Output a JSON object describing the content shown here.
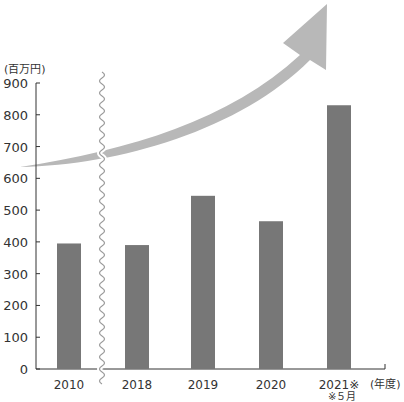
{
  "chart_data": {
    "type": "bar",
    "title": "",
    "ylabel": "(百万円)",
    "xlabel": "(年度)",
    "categories": [
      "2010",
      "2018",
      "2019",
      "2020",
      "2021※"
    ],
    "category_notes": {
      "2021※": "※5月"
    },
    "values": [
      395,
      390,
      545,
      465,
      830
    ],
    "ylim": [
      0,
      900
    ],
    "yticks": [
      0,
      100,
      200,
      300,
      400,
      500,
      600,
      700,
      800,
      900
    ],
    "grid": false,
    "legend": null,
    "annotations": [
      "axis break (wavy line) between 2010 and 2018",
      "large upward-curving arrow indicating growth"
    ],
    "colors": {
      "bar": "#777777",
      "arrow": "#b8b8b8",
      "axis": "#333333"
    }
  },
  "labels": {
    "y_unit": "(百万円)",
    "x_unit": "(年度)",
    "footnote": "※５月"
  }
}
